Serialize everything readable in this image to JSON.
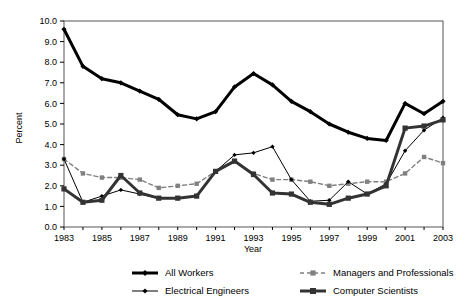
{
  "chart_data": {
    "type": "line",
    "title": "",
    "xlabel": "Year",
    "ylabel": "Percent",
    "xlim": [
      1983,
      2003
    ],
    "ylim": [
      0.0,
      10.0
    ],
    "ytick_step": 1.0,
    "grid": false,
    "legend_position": "bottom",
    "x": [
      1983,
      1984,
      1985,
      1986,
      1987,
      1988,
      1989,
      1990,
      1991,
      1992,
      1993,
      1994,
      1995,
      1996,
      1997,
      1998,
      1999,
      2000,
      2001,
      2002,
      2003
    ],
    "xticks": [
      1983,
      1985,
      1987,
      1989,
      1991,
      1993,
      1995,
      1997,
      1999,
      2001,
      2003
    ],
    "yticks": [
      "0.0",
      "1.0",
      "2.0",
      "3.0",
      "4.0",
      "5.0",
      "6.0",
      "7.0",
      "8.0",
      "9.0",
      "10.0"
    ],
    "series": [
      {
        "name": "All Workers",
        "color": "#000000",
        "width": 3.0,
        "dash": "none",
        "marker": "diamond",
        "values": [
          9.6,
          7.8,
          7.2,
          7.0,
          6.6,
          6.2,
          5.45,
          5.25,
          5.6,
          6.8,
          7.45,
          6.9,
          6.1,
          5.6,
          5.0,
          4.6,
          4.3,
          4.2,
          6.0,
          5.5,
          6.1
        ]
      },
      {
        "name": "Managers and Professionals",
        "color": "#808080",
        "width": 1.4,
        "dash": "4,3",
        "marker": "square",
        "values": [
          3.3,
          2.6,
          2.4,
          2.4,
          2.3,
          1.9,
          2.0,
          2.1,
          2.7,
          3.2,
          2.6,
          2.3,
          2.3,
          2.2,
          2.0,
          2.1,
          2.2,
          2.2,
          2.6,
          3.4,
          3.1
        ]
      },
      {
        "name": "Electrical Engineers",
        "color": "#000000",
        "width": 1.0,
        "dash": "none",
        "marker": "diamond",
        "values": [
          3.3,
          1.2,
          1.5,
          1.8,
          1.6,
          1.4,
          1.4,
          1.5,
          2.7,
          3.5,
          3.6,
          3.9,
          2.3,
          1.25,
          1.3,
          2.2,
          1.6,
          2.1,
          3.7,
          4.7,
          5.3
        ]
      },
      {
        "name": "Computer Scientists",
        "color": "#333333",
        "width": 3.0,
        "dash": "none",
        "marker": "square",
        "values": [
          1.85,
          1.2,
          1.3,
          2.5,
          1.65,
          1.4,
          1.4,
          1.5,
          2.7,
          3.2,
          2.55,
          1.65,
          1.6,
          1.2,
          1.1,
          1.4,
          1.6,
          2.0,
          4.8,
          4.9,
          5.2
        ]
      }
    ]
  },
  "legend": {
    "items": [
      {
        "label": "All Workers"
      },
      {
        "label": "Managers and Professionals"
      },
      {
        "label": "Electrical Engineers"
      },
      {
        "label": "Computer Scientists"
      }
    ]
  }
}
